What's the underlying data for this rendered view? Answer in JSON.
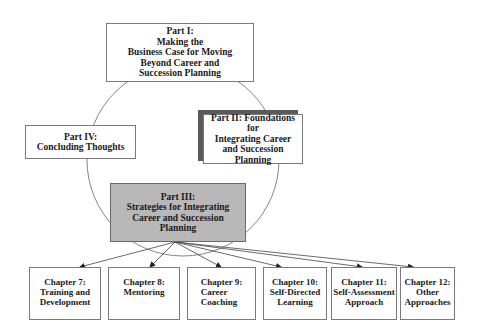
{
  "diagram": {
    "cycle_parts": [
      {
        "id": "part1",
        "label": "Part I:\nMaking the\nBusiness Case for Moving\nBeyond Career and\nSuccession Planning"
      },
      {
        "id": "part2",
        "label": "Part II: Foundations for\nIntegrating Career\nand Succession\nPlanning"
      },
      {
        "id": "part3",
        "label": "Part III:\nStrategies for Integrating\nCareer and Succession\nPlanning"
      },
      {
        "id": "part4",
        "label": "Part IV:\nConcluding Thoughts"
      }
    ],
    "chapters": [
      {
        "id": "ch7",
        "label": "Chapter 7:\nTraining and\nDevelopment"
      },
      {
        "id": "ch8",
        "label": "Chapter 8:\nMentoring"
      },
      {
        "id": "ch9",
        "label": "Chapter 9:\nCareer\nCoaching"
      },
      {
        "id": "ch10",
        "label": "Chapter 10:\nSelf-Directed\nLearning"
      },
      {
        "id": "ch11",
        "label": "Chapter 11:\nSelf-Assessment\nApproach"
      },
      {
        "id": "ch12",
        "label": "Chapter 12:\nOther\nApproaches"
      }
    ],
    "colors": {
      "highlight_fill": "#b8b8b8",
      "shadow": "#5a5a5a",
      "line": "#555555"
    }
  }
}
